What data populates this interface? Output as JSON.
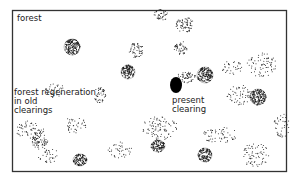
{
  "labels": {
    "forest": "forest",
    "regeneration": [
      "forest regeneration",
      "in old",
      "clearings"
    ],
    "present": [
      "present",
      "clearing"
    ]
  },
  "patches": [
    {
      "name": "patch-dense",
      "kind": "dense",
      "density": 0.9
    },
    {
      "name": "patch-sparse",
      "kind": "sparse",
      "density": 0.35
    },
    {
      "name": "patch-scattered",
      "kind": "scattered",
      "density": 0.15
    },
    {
      "name": "present-clearing",
      "kind": "solid",
      "density": 1.0
    }
  ],
  "colors": {
    "ink": "#1a1a1a",
    "frame": "#333333",
    "background": "#ffffff"
  }
}
